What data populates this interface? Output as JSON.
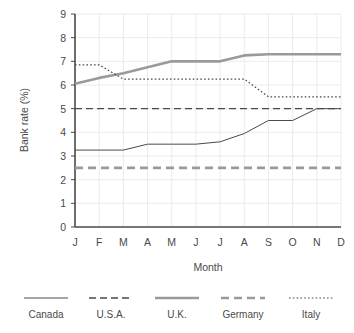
{
  "chart_data": {
    "type": "line",
    "title": "",
    "xlabel": "Month",
    "ylabel": "Bank rate (%)",
    "categories": [
      "J",
      "F",
      "M",
      "A",
      "M",
      "J",
      "J",
      "A",
      "S",
      "O",
      "N",
      "D"
    ],
    "category_names": [
      "January",
      "February",
      "March",
      "April",
      "May",
      "June",
      "July",
      "August",
      "September",
      "October",
      "November",
      "December"
    ],
    "ylim": [
      0,
      9
    ],
    "yticks": [
      0,
      1,
      2,
      3,
      4,
      5,
      6,
      7,
      8,
      9
    ],
    "grid": true,
    "legend_position": "bottom",
    "series": [
      {
        "name": "Canada",
        "style": "solid",
        "color": "#4a4a4a",
        "width": 1,
        "values": [
          3.25,
          3.25,
          3.25,
          3.5,
          3.5,
          3.5,
          3.6,
          3.95,
          4.5,
          4.5,
          5.0,
          5.0
        ]
      },
      {
        "name": "U.S.A.",
        "style": "dashed",
        "color": "#4a4a4a",
        "width": 1.4,
        "values": [
          5.0,
          5.0,
          5.0,
          5.0,
          5.0,
          5.0,
          5.0,
          5.0,
          5.0,
          5.0,
          5.0,
          5.0
        ]
      },
      {
        "name": "U.K.",
        "style": "solid",
        "color": "#9a9a9a",
        "width": 2.6,
        "values": [
          6.05,
          6.3,
          6.5,
          6.75,
          7.0,
          7.0,
          7.0,
          7.25,
          7.3,
          7.3,
          7.3,
          7.3
        ]
      },
      {
        "name": "Germany",
        "style": "dashed",
        "color": "#9a9a9a",
        "width": 2.6,
        "values": [
          2.5,
          2.5,
          2.5,
          2.5,
          2.5,
          2.5,
          2.5,
          2.5,
          2.5,
          2.5,
          2.5,
          2.5
        ]
      },
      {
        "name": "Italy",
        "style": "dotted",
        "color": "#4a4a4a",
        "width": 1.2,
        "values": [
          6.85,
          6.85,
          6.25,
          6.25,
          6.25,
          6.25,
          6.25,
          6.25,
          5.5,
          5.5,
          5.5,
          5.5
        ]
      }
    ]
  },
  "axis": {
    "y_title": "Bank rate (%)",
    "x_title": "Month",
    "y_tick_labels": [
      "9",
      "8",
      "7",
      "6",
      "5",
      "4",
      "3",
      "2",
      "1",
      "0"
    ],
    "x_tick_labels": [
      "J",
      "F",
      "M",
      "A",
      "M",
      "J",
      "J",
      "A",
      "S",
      "O",
      "N",
      "D"
    ]
  },
  "legend": {
    "items": [
      {
        "label": "Canada",
        "swatch": "solid-thin-dark"
      },
      {
        "label": "U.S.A.",
        "swatch": "dashed-thin-dark"
      },
      {
        "label": "U.K.",
        "swatch": "solid-thick-gray"
      },
      {
        "label": "Germany",
        "swatch": "dashed-thick-gray"
      },
      {
        "label": "Italy",
        "swatch": "dotted-fine-dark"
      }
    ]
  },
  "colors": {
    "background": "#ffffff",
    "axis": "#4a4a4a",
    "grid": "#e6e6e6",
    "dark_series": "#4a4a4a",
    "gray_series": "#9a9a9a",
    "text": "#4a4a4a"
  }
}
